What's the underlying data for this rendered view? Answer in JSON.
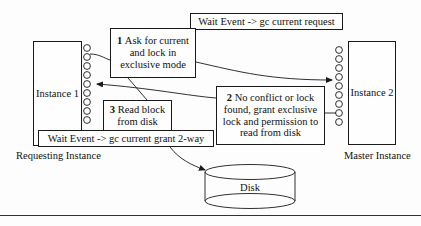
{
  "diagram": {
    "background_color": "#fdfdfd",
    "stroke_color": "#1a1a1a",
    "text_color": "#111111"
  },
  "nodes": {
    "instance1": {
      "label": "Instance 1",
      "caption": "Requesting Instance",
      "ports": 9
    },
    "instance2": {
      "label": "Instance 2",
      "caption": "Master Instance",
      "ports": 9
    },
    "disk": {
      "label": "Disk"
    }
  },
  "wait_events": {
    "top": "Wait Event -> gc current request",
    "bottom": "Wait Event -> gc current grant 2-way"
  },
  "steps": [
    {
      "number": "1",
      "text": "Ask for current and lock in exclusive mode",
      "lines": [
        "Ask for current",
        "and lock in",
        "exclusive mode"
      ]
    },
    {
      "number": "2",
      "text": "No conflict or lock found, grant exclusive lock and permission to read from disk",
      "lines": [
        "No conflict or lock",
        "found, grant exclusive",
        "lock and permission to",
        "read from disk"
      ]
    },
    {
      "number": "3",
      "text": "Read block from disk",
      "lines": [
        "Read block",
        "from disk"
      ]
    }
  ]
}
